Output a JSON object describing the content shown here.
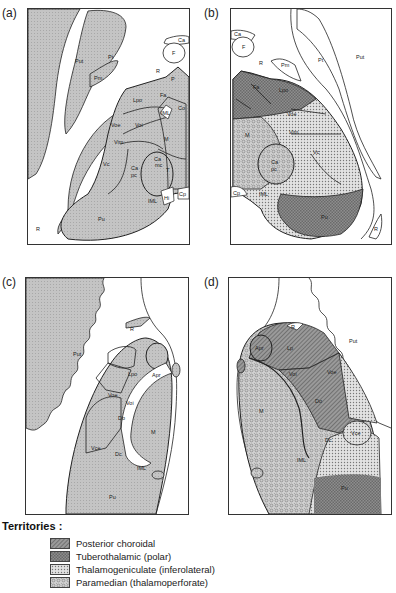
{
  "panels": [
    {
      "id": "a",
      "label": "(a)",
      "structures": [
        "Ca",
        "F",
        "R",
        "Put",
        "Pt",
        "Pm",
        "P",
        "m",
        "Fa",
        "Lpo",
        "Co",
        "IML",
        "Voe",
        "Voi",
        "Vim",
        "M",
        "Vc",
        "Ca mc",
        "Ca pc",
        "T",
        "H",
        "Hi",
        "IML",
        "Cp",
        "Pu",
        "R"
      ]
    },
    {
      "id": "b",
      "label": "(b)",
      "structures": [
        "Ca",
        "F",
        "R",
        "Pm",
        "Pt",
        "Put",
        "Fa",
        "Lpo",
        "Co",
        "Voe",
        "Voi",
        "Vim",
        "M",
        "Vc",
        "Ca pc",
        "Cp",
        "Hi",
        "IML",
        "Pu",
        "R"
      ]
    },
    {
      "id": "c",
      "label": "(c)",
      "structures": [
        "Put",
        "R",
        "Lpo",
        "Apr",
        "Voe",
        "Voi",
        "Do",
        "M",
        "Vce",
        "Dc",
        "IML",
        "Pu"
      ]
    },
    {
      "id": "d",
      "label": "(d)",
      "structures": [
        "Put",
        "R",
        "Apr",
        "Lp",
        "Voe",
        "Voi",
        "Do",
        "M",
        "Vce",
        "Dc",
        "IML",
        "Pu"
      ]
    }
  ],
  "labels": {
    "a": {
      "Put": "Put",
      "Pt": "Pt",
      "Pm": "Pm",
      "Ca": "Ca",
      "F": "F",
      "R": "R",
      "R2": "R",
      "P": "P",
      "Fa": "Fa",
      "Lpo": "Lpo",
      "Co": "Co",
      "IML": "IML",
      "Voe": "Voe",
      "Voi": "Voi",
      "Vim": "Vim",
      "M": "M",
      "Vc": "Vc",
      "Camc": "Ca",
      "mc": "mc",
      "Capc": "Ca",
      "pc": "pc",
      "T": "T",
      "Hi": "Hi",
      "IML2": "IML",
      "Cp": "Cp",
      "Pu": "Pu"
    },
    "b": {
      "Ca": "Ca",
      "F": "F",
      "R": "R",
      "Pm": "Pm",
      "Pt": "Pt",
      "Put": "Put",
      "Fa": "Fa",
      "Lpo": "Lpo",
      "Voe": "Voe",
      "Vim": "Vim",
      "M": "M",
      "Vc": "Vc",
      "Capc": "Ca",
      "pc": "pc",
      "Cp": "Cp",
      "IML": "IML",
      "Pu": "Pu",
      "R2": "R"
    },
    "c": {
      "Put": "Put",
      "R": "R",
      "Lpo": "Lpo",
      "Apr": "Apr",
      "Voe": "Voe",
      "Voi": "Voi",
      "Do": "Do",
      "M": "M",
      "Vce": "Vce",
      "Dc": "Dc",
      "IML": "IML",
      "Pu": "Pu"
    },
    "d": {
      "Put": "Put",
      "R": "R",
      "Apr": "Apr",
      "Lp": "Lp",
      "Voe": "Voe",
      "Voi": "Voi",
      "Do": "Do",
      "M": "M",
      "Vce": "Vce",
      "Dc": "Dc",
      "IML": "IML",
      "Pu": "Pu"
    }
  },
  "legend": {
    "title": "Territories :",
    "items": [
      {
        "label": "Posterior choroidal",
        "pattern": "hatch"
      },
      {
        "label": "Tuberothalamic (polar)",
        "pattern": "crosshatch"
      },
      {
        "label": "Thalamogeniculate (inferolateral)",
        "pattern": "dots"
      },
      {
        "label": "Paramedian (thalamoperforate)",
        "pattern": "circles"
      }
    ]
  },
  "colors": {
    "region_fill": "#bdbdbd",
    "outline": "#222222",
    "background": "#ffffff"
  }
}
